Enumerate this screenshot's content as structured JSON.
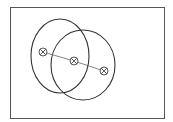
{
  "diagram": {
    "canvas": {
      "width": 173,
      "height": 122,
      "background": "#ffffff"
    },
    "frame": {
      "x": 10,
      "y": 7,
      "width": 154,
      "height": 111,
      "stroke": "#555555"
    },
    "ellipses": [
      {
        "id": "left",
        "cx": 60,
        "cy": 56,
        "rx": 29,
        "ry": 37,
        "stroke": "#333333"
      },
      {
        "id": "right",
        "cx": 83,
        "cy": 65,
        "rx": 32,
        "ry": 35,
        "stroke": "#333333"
      }
    ],
    "markers": [
      {
        "id": "left",
        "cx": 43,
        "cy": 52,
        "r": 4
      },
      {
        "id": "center",
        "cx": 74,
        "cy": 61,
        "r": 4
      },
      {
        "id": "right",
        "cx": 104,
        "cy": 71,
        "r": 4
      }
    ],
    "connector": {
      "stroke": "#666666"
    }
  }
}
